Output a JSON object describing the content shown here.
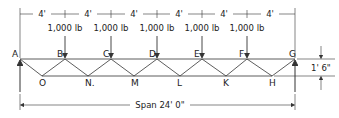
{
  "diagram": {
    "type": "truss",
    "panel_spacing_label": "4'",
    "panel_count": 6,
    "load_label": "1,000 lb",
    "height_label": "1' 6\"",
    "span_label": "Span 24' 0\"",
    "top_nodes": [
      "A",
      "B",
      "C",
      "D",
      "E",
      "F",
      "G"
    ],
    "bottom_nodes": [
      "O",
      "N.",
      "M",
      "L",
      "K",
      "H"
    ],
    "loaded_nodes": [
      "B",
      "C",
      "D",
      "E",
      "F"
    ],
    "supports": [
      "A",
      "G"
    ]
  },
  "labels": {
    "A": "A",
    "B": "B",
    "C": "C",
    "D": "D",
    "E": "E",
    "F": "F",
    "G": "G",
    "O": "O",
    "N": "N.",
    "M": "M",
    "L": "L",
    "K": "K",
    "H": "H"
  },
  "spacing": [
    "4'",
    "4'",
    "4'",
    "4'",
    "4'",
    "4'"
  ],
  "loads": [
    "1,000 lb",
    "1,000 lb",
    "1,000 lb",
    "1,000 lb",
    "1,000 lb"
  ],
  "dims": {
    "height": "1' 6\"",
    "span": "Span 24' 0\""
  }
}
